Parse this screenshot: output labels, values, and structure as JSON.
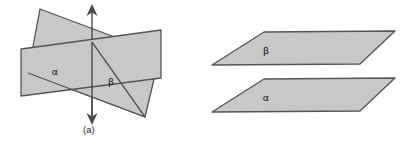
{
  "figure": {
    "background_color": "#ffffff",
    "plane_fill": "#c8c8c8",
    "plane_stroke": "#555555",
    "axis_color": "#4a4a4a",
    "text_color": "#111111"
  },
  "panels": [
    {
      "id": "a",
      "caption": "(a)",
      "description": "Two planes intersecting along a vertical line",
      "labels": [
        {
          "name": "alpha",
          "text": "α",
          "x": 55,
          "y": 72
        },
        {
          "name": "beta",
          "text": "β",
          "x": 111,
          "y": 82
        }
      ],
      "axis": {
        "name": "intersection-line",
        "x": 92,
        "y_top": 7,
        "y_bottom": 122,
        "arrow_top": true,
        "arrow_bottom": true
      },
      "shapes": [
        {
          "name": "plane-beta",
          "points": "40,9 160,54 145,117 28,73",
          "fill": "#c8c8c8",
          "stroke": "#555555"
        },
        {
          "name": "plane-alpha",
          "points": "21,49 161,30 161,78 21,96",
          "fill": "#c8c8c8",
          "stroke": "#555555"
        }
      ]
    },
    {
      "id": "b",
      "caption": "(b)",
      "description": "Two parallel planes, beta above alpha",
      "labels": [
        {
          "name": "beta",
          "text": "β",
          "x": 76,
          "y": 51
        },
        {
          "name": "alpha",
          "text": "α",
          "x": 76,
          "y": 98
        }
      ],
      "shapes": [
        {
          "name": "plane-beta",
          "points": "74,32 205,31 170,64 22,65",
          "fill": "#c8c8c8",
          "stroke": "#555555"
        },
        {
          "name": "plane-alpha",
          "points": "74,79 205,78 170,111 22,112",
          "fill": "#c8c8c8",
          "stroke": "#555555"
        }
      ]
    }
  ]
}
